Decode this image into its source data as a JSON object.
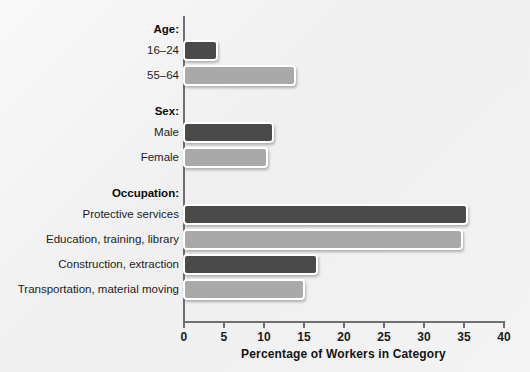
{
  "chart_data": {
    "type": "bar",
    "orientation": "horizontal",
    "title": "",
    "xlabel": "Percentage of Workers in Category",
    "ylabel": "",
    "xlim": [
      0,
      40
    ],
    "xticks": [
      0,
      5,
      10,
      15,
      20,
      25,
      30,
      35,
      40
    ],
    "grid": false,
    "legend": "none",
    "groups": [
      {
        "header": "Age:",
        "categories": [
          "16–24",
          "55–64"
        ],
        "values": [
          4.4,
          14.1
        ],
        "shades": [
          "dark",
          "light"
        ]
      },
      {
        "header": "Sex:",
        "categories": [
          "Male",
          "Female"
        ],
        "values": [
          11.4,
          10.6
        ],
        "shades": [
          "dark",
          "light"
        ]
      },
      {
        "header": "Occupation:",
        "categories": [
          "Protective services",
          "Education, training, library",
          "Construction, extraction",
          "Transportation, material moving"
        ],
        "values": [
          35.6,
          35.0,
          16.9,
          15.3
        ],
        "shades": [
          "dark",
          "light",
          "dark",
          "light"
        ]
      }
    ],
    "colors": {
      "dark_bar": "#4a4a4a",
      "light_bar": "#a9a9a9",
      "bar_outline": "#ffffff",
      "axis": "#6f6f6f",
      "text": "#1d1d1d",
      "background": "#f1f1f1"
    }
  },
  "axis": {
    "tick_labels": [
      "0",
      "5",
      "10",
      "15",
      "20",
      "25",
      "30",
      "35",
      "40"
    ],
    "title": "Percentage of Workers in Category"
  },
  "rows": [
    {
      "kind": "header",
      "label": "Age:"
    },
    {
      "kind": "bar",
      "label": "16–24",
      "value": 4.4,
      "shade": "dark"
    },
    {
      "kind": "bar",
      "label": "55–64",
      "value": 14.1,
      "shade": "light"
    },
    {
      "kind": "header",
      "label": "Sex:"
    },
    {
      "kind": "bar",
      "label": "Male",
      "value": 11.4,
      "shade": "dark"
    },
    {
      "kind": "bar",
      "label": "Female",
      "value": 10.6,
      "shade": "light"
    },
    {
      "kind": "header",
      "label": "Occupation:"
    },
    {
      "kind": "bar",
      "label": "Protective services",
      "value": 35.6,
      "shade": "dark"
    },
    {
      "kind": "bar",
      "label": "Education, training, library",
      "value": 35.0,
      "shade": "light"
    },
    {
      "kind": "bar",
      "label": "Construction, extraction",
      "value": 16.9,
      "shade": "dark"
    },
    {
      "kind": "bar",
      "label": "Transportation, material moving",
      "value": 15.3,
      "shade": "light"
    }
  ]
}
